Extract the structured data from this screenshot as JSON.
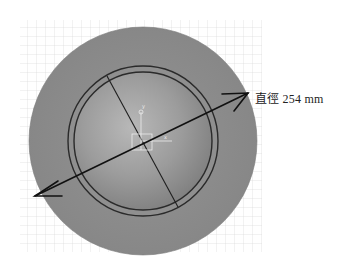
{
  "figure": {
    "dimension_label": "直徑 254 mm",
    "dimension": {
      "name": "直徑",
      "value": 254,
      "unit": "mm"
    },
    "colors": {
      "background": "#ffffff",
      "grid": "#d9d9d9",
      "disc_fill": "#8c8c8c",
      "dome_fill": "#9a9a9a",
      "dome_highlight": "#b5b5b5",
      "ring_stroke": "#2a2a2a",
      "arrow": "#111111",
      "triad": "#e8e8e8"
    },
    "triad": {
      "y_label": "y",
      "x_label": "x"
    },
    "icons": [
      "dimension-arrow-icon",
      "coordinate-triad-icon"
    ]
  }
}
